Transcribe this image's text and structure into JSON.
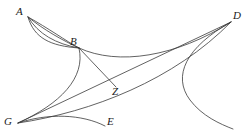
{
  "figure": {
    "width": 252,
    "height": 138,
    "background_color": "#ffffff",
    "stroke_color": "#3a3a3a"
  },
  "labels": [
    {
      "id": "A",
      "text": "A",
      "x": 16,
      "y": 6
    },
    {
      "id": "B",
      "text": "B",
      "x": 70,
      "y": 36
    },
    {
      "id": "D",
      "text": "D",
      "x": 233,
      "y": 10
    },
    {
      "id": "Z",
      "text": "Z",
      "x": 112,
      "y": 86
    },
    {
      "id": "G",
      "text": "G",
      "x": 4,
      "y": 116
    },
    {
      "id": "E",
      "text": "E",
      "x": 107,
      "y": 116
    }
  ],
  "points": {
    "A": {
      "x": 28,
      "y": 17
    },
    "B": {
      "x": 79,
      "y": 48
    },
    "D": {
      "x": 231,
      "y": 22
    },
    "Z": {
      "x": 116,
      "y": 87
    },
    "G": {
      "x": 18,
      "y": 123
    },
    "E": {
      "x": 105,
      "y": 126
    },
    "tail": {
      "x": 233,
      "y": 129
    }
  },
  "curves": [
    {
      "id": "AB-outer",
      "name": "curve-a-to-b-outer",
      "d": "M 28 17 C 44 30 62 40 79 48"
    },
    {
      "id": "AB-middle",
      "name": "curve-a-to-b-middle",
      "d": "M 28 17 C 38 34 56 44 79 48"
    },
    {
      "id": "AB-inner",
      "name": "curve-a-to-b-inner",
      "d": "M 28 17 C 34 38 50 46 79 48"
    },
    {
      "id": "AB-chord",
      "name": "curve-a-to-b-chord",
      "d": "M 28 17 C 48 28 66 41 79 48"
    },
    {
      "id": "BD",
      "name": "curve-b-to-d",
      "d": "M 79 48 C 118 66 176 57 231 22"
    },
    {
      "id": "BG",
      "name": "curve-b-to-g",
      "d": "M 79 48 C 86 78 60 104 18 123"
    },
    {
      "id": "BZ",
      "name": "line-b-to-z",
      "d": "M 79 48 L 116 87"
    },
    {
      "id": "GD",
      "name": "line-g-to-d",
      "d": "M 18 123 L 231 22"
    },
    {
      "id": "GD-curve",
      "name": "curve-g-to-d",
      "d": "M 18 123 C 92 112 174 80 231 22"
    },
    {
      "id": "GE",
      "name": "curve-g-to-e",
      "d": "M 18 123 C 48 113 82 114 105 126"
    },
    {
      "id": "D-tail",
      "name": "curve-d-to-tail",
      "d": "M 231 22 C 186 47 172 76 190 100 C 202 116 220 124 233 129"
    }
  ]
}
